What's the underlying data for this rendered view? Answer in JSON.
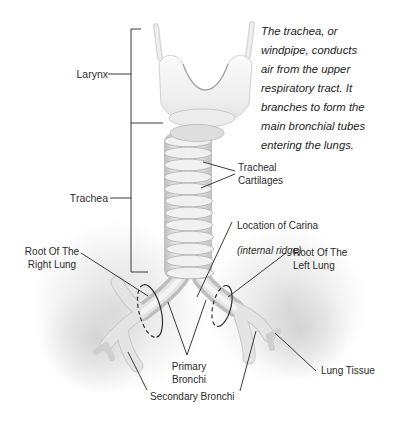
{
  "figure": {
    "title_context": "Trachea anatomy diagram",
    "description_paragraph": "The trachea, or\nwindpipe, conducts\nair from the upper\nrespiratory tract. It\nbranches to form the\nmain bronchial tubes\nentering the lungs.",
    "labels": {
      "larynx": "Larynx",
      "trachea": "Trachea",
      "tracheal_cartilages": "Tracheal\nCartilages",
      "carina_line1": "Location of Carina",
      "carina_line2": "(internal ridge)",
      "root_right_lung": "Root Of The\nRight Lung",
      "root_left_lung": "Root Of The\nLeft Lung",
      "primary_bronchi": "Primary\nBronchi",
      "secondary_bronchi": "Secondary Bronchi",
      "lung_tissue": "Lung Tissue"
    },
    "colors": {
      "background": "#ffffff",
      "label_text": "#2b2b2b",
      "leader_line": "#3a3a3a",
      "anatomy_outline": "#b9b9b9",
      "anatomy_fill_light": "#f5f5f5",
      "anatomy_fill_shade": "#d9d9d9",
      "lung_tissue_fill": "#d6d6d6",
      "root_ellipse_stroke": "#2f2f2f"
    }
  }
}
